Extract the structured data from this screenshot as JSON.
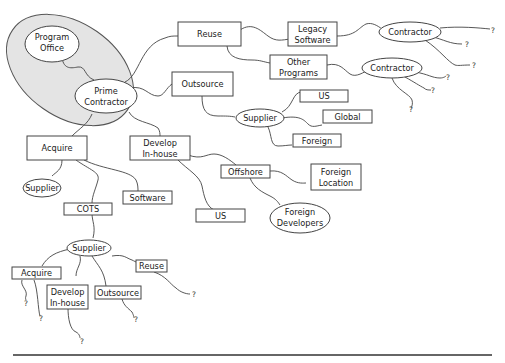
{
  "diagram": {
    "group": {
      "label": "program-office-prime-contractor-group",
      "fill": "#e4e4e4"
    },
    "nodes": {
      "program_office": {
        "line1": "Program",
        "line2": "Office"
      },
      "prime_contractor": {
        "line1": "Prime",
        "line2": "Contractor"
      },
      "reuse": "Reuse",
      "legacy_software": {
        "line1": "Legacy",
        "line2": "Software"
      },
      "other_programs": {
        "line1": "Other",
        "line2": "Programs"
      },
      "contractor_1": "Contractor",
      "contractor_2": "Contractor",
      "outsource": "Outsource",
      "supplier_outsource": "Supplier",
      "us_1": "US",
      "global": "Global",
      "foreign": "Foreign",
      "acquire": "Acquire",
      "develop_inhouse": {
        "line1": "Develop",
        "line2": "In-house"
      },
      "supplier_acquire": "Supplier",
      "software": "Software",
      "cots": "COTS",
      "offshore": "Offshore",
      "foreign_location": {
        "line1": "Foreign",
        "line2": "Location"
      },
      "foreign_developers": {
        "line1": "Foreign",
        "line2": "Developers"
      },
      "us_2": "US",
      "supplier_cots": "Supplier",
      "acquire_2": "Acquire",
      "develop_inhouse_2": {
        "line1": "Develop",
        "line2": "In-house"
      },
      "outsource_2": "Outsource",
      "reuse_2": "Reuse"
    },
    "unknown_marker": "?"
  }
}
